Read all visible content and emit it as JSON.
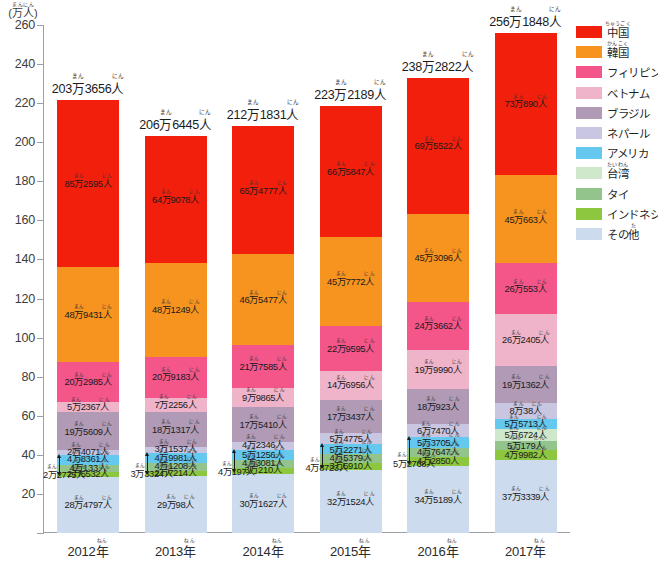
{
  "chart_data": {
    "type": "bar",
    "stacked": true,
    "title": "",
    "xlabel": "",
    "ylabel": "(万人)",
    "ylabel_ruby": "まんにん",
    "ylim": [
      0,
      260
    ],
    "ytick_step": 20,
    "yticks": [
      0,
      20,
      40,
      60,
      80,
      100,
      120,
      140,
      160,
      180,
      200,
      220,
      240,
      260
    ],
    "ytick_labels": [
      "0",
      "20",
      "40",
      "60",
      "80",
      "100",
      "120",
      "140",
      "160",
      "180",
      "200",
      "220",
      "240",
      "260"
    ],
    "grid": false,
    "legend_position": "right",
    "unit_note": "万人",
    "categories": [
      "2012年",
      "2013年",
      "2014年",
      "2015年",
      "2016年",
      "2017年"
    ],
    "totals": [
      "203万3656人",
      "206万6445人",
      "212万1831人",
      "223万2189人",
      "238万2822人",
      "256万1848人"
    ],
    "totals_numeric": [
      2033656,
      2066445,
      2121831,
      2232189,
      2382822,
      2561848
    ],
    "series": [
      {
        "name": "中国",
        "name_ruby": "ちゅうごく",
        "color": "#f21f0c",
        "labels": [
          "85万2595人",
          "64万9078人",
          "65万4777人",
          "66万5847人",
          "69万5522人",
          "73万890人"
        ],
        "values": [
          852595,
          649078,
          654777,
          665847,
          695522,
          730890
        ]
      },
      {
        "name": "韓国",
        "name_ruby": "かんこく",
        "color": "#f79420",
        "labels": [
          "48万9431人",
          "48万1249人",
          "46万5477人",
          "45万7772人",
          "45万3096人",
          "45万663人"
        ],
        "values": [
          489431,
          481249,
          465477,
          457772,
          453096,
          450663
        ]
      },
      {
        "name": "フィリピン",
        "name_ruby": "",
        "color": "#f4568a",
        "labels": [
          "20万2985人",
          "20万9183人",
          "21万7585人",
          "22万9595人",
          "24万3662人",
          "26万553人"
        ],
        "values": [
          202985,
          209183,
          217585,
          229595,
          243662,
          260553
        ]
      },
      {
        "name": "ベトナム",
        "name_ruby": "",
        "color": "#efb4c9",
        "labels": [
          "5万2367人",
          "7万2256人",
          "9万9865人",
          "14万6956人",
          "19万9990人",
          "26万2405人"
        ],
        "values": [
          52367,
          72256,
          99865,
          146956,
          199990,
          262405
        ]
      },
      {
        "name": "ブラジル",
        "name_ruby": "",
        "color": "#b09ab5",
        "labels": [
          "19万5609人",
          "18万1317人",
          "17万5410人",
          "17万3437人",
          "18万923人",
          "19万1362人"
        ],
        "values": [
          195609,
          181317,
          175410,
          173437,
          180923,
          191362
        ]
      },
      {
        "name": "ネパール",
        "name_ruby": "",
        "color": "#c9c6e2",
        "labels": [
          "2万4071人",
          "3万1537人",
          "4万2346人",
          "5万4775人",
          "6万7470人",
          "8万38人"
        ],
        "values": [
          24071,
          31537,
          42346,
          54775,
          67470,
          80038
        ]
      },
      {
        "name": "アメリカ",
        "name_ruby": "",
        "color": "#64c8ef",
        "labels": [
          "4万8361人",
          "4万9981人",
          "5万1256人",
          "5万2271人",
          "5万3705人",
          "5万5713人"
        ],
        "values": [
          48361,
          49981,
          51256,
          52271,
          53705,
          55713
        ]
      },
      {
        "name": "台湾",
        "name_ruby": "たいわん",
        "color": "#cfe8cc",
        "labels": [
          "",
          "",
          "",
          "",
          "",
          "5万6724人"
        ],
        "values": [
          0,
          0,
          0,
          0,
          0,
          56724
        ]
      },
      {
        "name": "タイ",
        "name_ruby": "",
        "color": "#93c48b",
        "labels": [
          "4万133人",
          "4万1208人",
          "4万3081人",
          "4万5379人",
          "4万7647人",
          "5万179人"
        ],
        "values": [
          40133,
          41208,
          43081,
          45379,
          47647,
          50179
        ]
      },
      {
        "name": "インドネシア",
        "name_ruby": "",
        "color": "#8dc63f",
        "labels": [
          "2万5532人",
          "2万7214人",
          "3万210人",
          "3万5910人",
          "4万2850人",
          "4万9982人"
        ],
        "values": [
          25532,
          27214,
          30210,
          35910,
          42850,
          49982
        ]
      },
      {
        "name": "その他",
        "name_ruby": "た",
        "color": "#ccdcee",
        "labels": [
          "28万4797人",
          "29万98人",
          "30万1627人",
          "32万1524人",
          "34万5189人",
          "37万3339人"
        ],
        "values": [
          284797,
          290098,
          301627,
          321524,
          345189,
          373339
        ],
        "extra_labels": [
          "2万2775人",
          "3万3324人",
          "4万197人",
          "4万8723人",
          "5万2768人",
          ""
        ]
      }
    ]
  },
  "legend": {
    "items": [
      {
        "label": "中国",
        "ruby": "ちゅうごく",
        "color": "#f21f0c"
      },
      {
        "label": "韓国",
        "ruby": "かんこく",
        "color": "#f79420"
      },
      {
        "label": "フィリピン",
        "ruby": "",
        "color": "#f4568a"
      },
      {
        "label": "ベトナム",
        "ruby": "",
        "color": "#efb4c9"
      },
      {
        "label": "ブラジル",
        "ruby": "",
        "color": "#b09ab5"
      },
      {
        "label": "ネパール",
        "ruby": "",
        "color": "#c9c6e2"
      },
      {
        "label": "アメリカ",
        "ruby": "",
        "color": "#64c8ef"
      },
      {
        "label": "台湾",
        "ruby": "たいわん",
        "color": "#cfe8cc"
      },
      {
        "label": "タイ",
        "ruby": "",
        "color": "#93c48b"
      },
      {
        "label": "インドネシア",
        "ruby": "",
        "color": "#8dc63f"
      },
      {
        "label": "その他",
        "ruby": "た",
        "color": "#ccdcee"
      }
    ]
  },
  "axis": {
    "unit_main": "(万人)",
    "unit_ruby": "まんにん",
    "year_ruby": "ねん"
  }
}
